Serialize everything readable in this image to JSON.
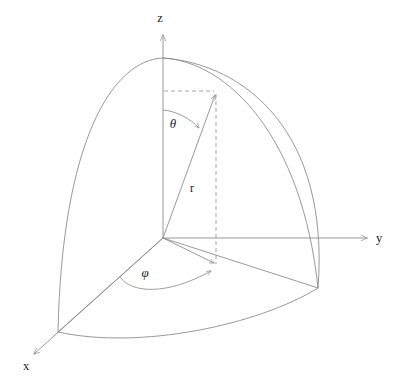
{
  "figure": {
    "background_color": "#ffffff",
    "line_color": "#8d8d8d",
    "label_color": "#1b1b1b",
    "labels": {
      "z_axis": "z",
      "y_axis": "y",
      "x_axis": "x",
      "radius": "r",
      "polar_angle": "θ",
      "azimuth_angle": "φ"
    },
    "geometry": {
      "origin": {
        "x": 163,
        "y": 238
      },
      "z_axis_tip": {
        "x": 163,
        "y": 33
      },
      "y_axis_tip": {
        "x": 369,
        "y": 238
      },
      "x_axis_tip": {
        "x": 32,
        "y": 356
      },
      "sphere_pole": {
        "x": 163,
        "y": 58
      },
      "point_p": {
        "x": 216,
        "y": 93
      },
      "projection_p": {
        "x": 216,
        "y": 265
      },
      "equator_y_end": {
        "x": 318,
        "y": 288
      },
      "equator_x_end": {
        "x": 58,
        "y": 332
      },
      "meridian_y_cross": {
        "x": 342,
        "y": 238
      },
      "radius_px": 180
    },
    "label_positions": {
      "z": {
        "x": 160,
        "y": 22
      },
      "y": {
        "x": 376,
        "y": 242
      },
      "x": {
        "x": 23,
        "y": 370
      },
      "r": {
        "x": 192,
        "y": 192
      },
      "theta": {
        "x": 173,
        "y": 128
      },
      "phi": {
        "x": 145,
        "y": 277
      }
    }
  }
}
